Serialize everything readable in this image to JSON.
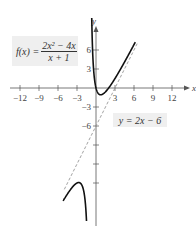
{
  "chart_data": {
    "type": "line",
    "title": "",
    "function_label": {
      "lhs": "f(x) = ",
      "numerator": "2x² − 4x",
      "denominator": "x + 1"
    },
    "asymptote_label": "y = 2x − 6",
    "xlabel": "x",
    "ylabel": "y",
    "xlim": [
      -14,
      15
    ],
    "ylim": [
      -19,
      13
    ],
    "x_ticks": [
      -12,
      -9,
      -6,
      -3,
      3,
      6,
      9,
      12
    ],
    "x_tick_labels": [
      "−12",
      "−9",
      "−6",
      "−3",
      "3",
      "6",
      "9",
      "12"
    ],
    "y_ticks": [
      6,
      3,
      -3,
      -6,
      -9,
      -12,
      -15
    ],
    "y_tick_labels_shown": [
      "6",
      "3",
      "−3",
      "−6"
    ],
    "series": [
      {
        "name": "f(x) = (2x^2 - 4x)/(x + 1), right branch",
        "style": "solid",
        "x": [
          -0.85,
          -0.7,
          -0.5,
          0,
          0.5,
          0.73,
          1,
          2,
          3,
          4,
          5,
          6
        ],
        "y": [
          25.5,
          10.7,
          6.0,
          0,
          -1.0,
          -1.07,
          -1.0,
          0,
          1.5,
          3.2,
          5.0,
          6.86
        ]
      },
      {
        "name": "f(x) = (2x^2 - 4x)/(x + 1), left branch",
        "style": "solid",
        "x": [
          -5,
          -4,
          -3,
          -2.73,
          -2,
          -1.5,
          -1.3
        ],
        "y": [
          -17.5,
          -16,
          -15,
          -14.93,
          -16,
          -21,
          -28.6
        ]
      },
      {
        "name": "slant asymptote y = 2x - 6",
        "style": "dashed",
        "x": [
          -5,
          6.5
        ],
        "y": [
          -16,
          7
        ]
      }
    ],
    "vertical_asymptote": -1,
    "grid": false
  }
}
